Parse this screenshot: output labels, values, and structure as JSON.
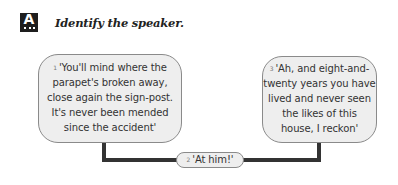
{
  "header": {
    "icon_letter": "A",
    "title": "Identify the speaker."
  },
  "bubbles": [
    {
      "number": "1",
      "text": "'You'll mind where the",
      "lines": [
        "'You'll mind where the",
        "parapet's broken away,",
        "close again the sign-post.",
        "It's never been mended",
        "since the accident'"
      ]
    },
    {
      "number": "2",
      "lines": [
        "'At him!'"
      ]
    },
    {
      "number": "3",
      "lines": [
        "'Ah, and eight-and-",
        "twenty years you have",
        "lived and never seen",
        "the likes of this",
        "house, I reckon'"
      ]
    }
  ],
  "colors": {
    "bubble_fill": "#eeeeee",
    "bubble_border": "#8a8a8a",
    "connector": "#333333",
    "icon_bg": "#1e1e1e"
  }
}
